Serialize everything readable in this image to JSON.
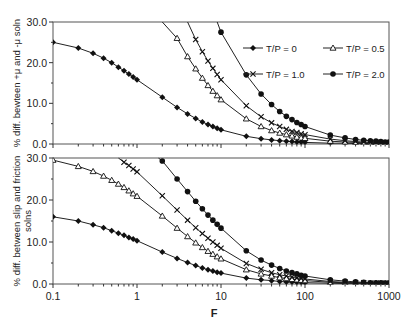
{
  "chart_data": [
    {
      "type": "line",
      "panel": "top",
      "ylabel": "% diff. bewteen +μ and -μ soln",
      "xlabel": "",
      "xscale": "log",
      "xlim": [
        0.1,
        1000
      ],
      "ylim": [
        0,
        30
      ],
      "yticks": [
        "0.0",
        "10.0",
        "20.0",
        "30.0"
      ],
      "legend_position": "upper right (inside)",
      "series": [
        {
          "name": "T/P = 0",
          "marker": "diamond",
          "x": [
            0.1,
            0.2,
            0.3,
            0.4,
            0.5,
            0.6,
            0.7,
            0.8,
            0.9,
            1,
            2,
            3,
            4,
            5,
            6,
            7,
            8,
            9,
            10,
            20,
            30,
            40,
            50,
            60,
            70,
            80,
            90,
            100,
            200,
            300,
            400,
            500,
            600,
            700,
            800,
            900,
            1000
          ],
          "y": [
            25.0,
            23.6,
            22.3,
            21.1,
            20.0,
            18.9,
            18.0,
            17.2,
            16.5,
            15.8,
            11.5,
            9.0,
            7.4,
            6.3,
            5.4,
            4.8,
            4.3,
            3.9,
            3.5,
            1.9,
            1.3,
            1.0,
            0.8,
            0.7,
            0.6,
            0.5,
            0.5,
            0.4,
            0.2,
            0.2,
            0.1,
            0.1,
            0.1,
            0.1,
            0.1,
            0.1,
            0.1
          ]
        },
        {
          "name": "T/P = 0.5",
          "marker": "triangle",
          "x": [
            2,
            3,
            4,
            5,
            6,
            7,
            8,
            9,
            10,
            20,
            30,
            40,
            50,
            60,
            70,
            80,
            90,
            100,
            200,
            300,
            400,
            500,
            600,
            700,
            800,
            900,
            1000
          ],
          "y": [
            30.0,
            26.0,
            21.5,
            18.5,
            16.2,
            14.4,
            13.0,
            11.9,
            10.9,
            6.2,
            4.3,
            3.3,
            2.7,
            2.3,
            2.0,
            1.7,
            1.5,
            1.4,
            0.7,
            0.5,
            0.4,
            0.3,
            0.3,
            0.2,
            0.2,
            0.2,
            0.2
          ]
        },
        {
          "name": "T/P = 1.0",
          "marker": "x",
          "x": [
            4,
            5,
            6,
            7,
            8,
            9,
            10,
            20,
            30,
            40,
            50,
            60,
            70,
            80,
            90,
            100,
            200,
            300,
            400,
            500,
            600,
            700,
            800,
            900,
            1000
          ],
          "y": [
            30.0,
            25.7,
            22.7,
            20.4,
            18.6,
            17.1,
            15.8,
            9.4,
            6.7,
            5.2,
            4.3,
            3.6,
            3.1,
            2.8,
            2.5,
            2.3,
            1.2,
            0.8,
            0.6,
            0.5,
            0.4,
            0.4,
            0.3,
            0.3,
            0.3
          ]
        },
        {
          "name": "T/P = 2.0",
          "marker": "circle",
          "x": [
            9,
            10,
            20,
            30,
            40,
            50,
            60,
            70,
            80,
            90,
            100,
            200,
            300,
            400,
            500,
            600,
            700,
            800,
            900,
            1000
          ],
          "y": [
            30.0,
            27.5,
            17.0,
            12.3,
            9.7,
            8.0,
            6.8,
            6.0,
            5.3,
            4.8,
            4.3,
            2.2,
            1.5,
            1.1,
            0.9,
            0.8,
            0.7,
            0.6,
            0.5,
            0.5
          ]
        }
      ]
    },
    {
      "type": "line",
      "panel": "bottom",
      "ylabel": "% diff. between slip and friction solns",
      "xlabel": "F",
      "xscale": "log",
      "xlim": [
        0.1,
        1000
      ],
      "ylim": [
        0,
        30
      ],
      "xticks": [
        "0.1",
        "1",
        "10",
        "100",
        "1000"
      ],
      "yticks": [
        "0.0",
        "10.0",
        "20.0",
        "30.0"
      ],
      "series": [
        {
          "name": "T/P = 0",
          "marker": "diamond",
          "x": [
            0.1,
            0.2,
            0.3,
            0.4,
            0.5,
            0.6,
            0.7,
            0.8,
            0.9,
            1,
            2,
            3,
            4,
            5,
            6,
            7,
            8,
            9,
            10,
            20,
            30,
            40,
            50,
            60,
            70,
            80,
            90,
            100,
            200,
            300,
            400,
            500,
            600,
            700,
            800,
            900,
            1000
          ],
          "y": [
            16.0,
            15.0,
            14.1,
            13.4,
            12.7,
            12.1,
            11.6,
            11.1,
            10.7,
            10.3,
            7.6,
            6.1,
            5.1,
            4.4,
            3.8,
            3.4,
            3.1,
            2.8,
            2.6,
            1.4,
            1.0,
            0.8,
            0.6,
            0.5,
            0.5,
            0.4,
            0.4,
            0.3,
            0.2,
            0.1,
            0.1,
            0.1,
            0.1,
            0.1,
            0.1,
            0.1,
            0.1
          ]
        },
        {
          "name": "T/P = 0.5",
          "marker": "triangle",
          "x": [
            0.1,
            0.2,
            0.3,
            0.4,
            0.5,
            0.6,
            0.7,
            0.8,
            0.9,
            1,
            2,
            3,
            4,
            5,
            6,
            7,
            8,
            9,
            10,
            20,
            30,
            40,
            50,
            60,
            70,
            80,
            90,
            100,
            200,
            300,
            400,
            500,
            600,
            700,
            800,
            900,
            1000
          ],
          "y": [
            29.5,
            28.0,
            26.8,
            25.7,
            24.7,
            23.8,
            23.0,
            22.2,
            21.5,
            20.9,
            16.2,
            13.3,
            11.3,
            9.8,
            8.7,
            7.8,
            7.1,
            6.5,
            6.0,
            3.4,
            2.4,
            1.9,
            1.5,
            1.3,
            1.1,
            1.0,
            0.9,
            0.8,
            0.4,
            0.3,
            0.2,
            0.2,
            0.2,
            0.1,
            0.1,
            0.1,
            0.1
          ]
        },
        {
          "name": "T/P = 1.0",
          "marker": "x",
          "x": [
            0.6,
            0.7,
            0.8,
            0.9,
            1,
            2,
            3,
            4,
            5,
            6,
            7,
            8,
            9,
            10,
            20,
            30,
            40,
            50,
            60,
            70,
            80,
            90,
            100,
            200,
            300,
            400,
            500,
            600,
            700,
            800,
            900,
            1000
          ],
          "y": [
            30.0,
            29.0,
            28.2,
            27.4,
            26.7,
            21.0,
            17.6,
            15.2,
            13.4,
            12.0,
            10.9,
            10.0,
            9.2,
            8.5,
            4.9,
            3.5,
            2.7,
            2.2,
            1.9,
            1.6,
            1.4,
            1.3,
            1.2,
            0.6,
            0.4,
            0.3,
            0.3,
            0.2,
            0.2,
            0.2,
            0.2,
            0.1
          ]
        },
        {
          "name": "T/P = 2.0",
          "marker": "circle",
          "x": [
            1.8,
            2,
            3,
            4,
            5,
            6,
            7,
            8,
            9,
            10,
            20,
            30,
            40,
            50,
            60,
            70,
            80,
            90,
            100,
            200,
            300,
            400,
            500,
            600,
            700,
            800,
            900,
            1000
          ],
          "y": [
            30.0,
            29.3,
            25.0,
            22.0,
            19.7,
            17.9,
            16.4,
            15.2,
            14.2,
            13.3,
            7.9,
            5.7,
            4.5,
            3.7,
            3.1,
            2.7,
            2.4,
            2.1,
            1.9,
            1.0,
            0.7,
            0.5,
            0.4,
            0.3,
            0.3,
            0.3,
            0.2,
            0.2
          ]
        }
      ]
    }
  ],
  "legend": {
    "items": [
      {
        "label": "T/P = 0",
        "marker": "diamond"
      },
      {
        "label": "T/P = 0.5",
        "marker": "triangle"
      },
      {
        "label": "T/P = 1.0",
        "marker": "x"
      },
      {
        "label": "T/P = 2.0",
        "marker": "circle"
      }
    ]
  }
}
